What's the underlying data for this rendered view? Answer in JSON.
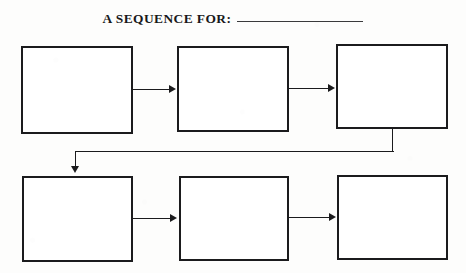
{
  "document": {
    "title": "A SEQUENCE FOR:",
    "type": "graphic-organizer-worksheet",
    "background_color": "#fdfdfc",
    "ink_color": "#1b1b1d"
  },
  "header": {
    "label": "A SEQUENCE FOR:",
    "fill_in_blank_value": "",
    "fill_in_blank_placeholder": ""
  },
  "flow": {
    "direction": "left-to-right, then wrap down and left-to-right",
    "step_count": 6,
    "steps": [
      {
        "index": 1,
        "row": 1,
        "column": 1,
        "value": "",
        "placeholder": ""
      },
      {
        "index": 2,
        "row": 1,
        "column": 2,
        "value": "",
        "placeholder": ""
      },
      {
        "index": 3,
        "row": 1,
        "column": 3,
        "value": "",
        "placeholder": ""
      },
      {
        "index": 4,
        "row": 2,
        "column": 1,
        "value": "",
        "placeholder": ""
      },
      {
        "index": 5,
        "row": 2,
        "column": 2,
        "value": "",
        "placeholder": ""
      },
      {
        "index": 6,
        "row": 2,
        "column": 3,
        "value": "",
        "placeholder": ""
      }
    ],
    "connectors": [
      {
        "from": 1,
        "to": 2,
        "kind": "arrow-right"
      },
      {
        "from": 2,
        "to": 3,
        "kind": "arrow-right"
      },
      {
        "from": 3,
        "to": 4,
        "kind": "wrap-elbow-arrow-down"
      },
      {
        "from": 4,
        "to": 5,
        "kind": "arrow-right"
      },
      {
        "from": 5,
        "to": 6,
        "kind": "arrow-right"
      }
    ]
  }
}
